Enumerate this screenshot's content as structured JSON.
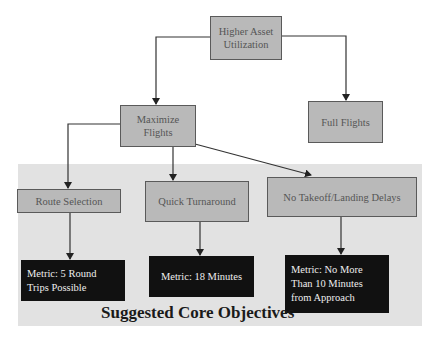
{
  "diagram": {
    "title": "Suggested Core Objectives",
    "nodes": {
      "root": "Higher Asset Utilization",
      "maximize": "Maximize Flights",
      "full": "Full Flights",
      "route": "Route Selection",
      "turnaround": "Quick Turnaround",
      "delays": "No Takeoff/Landing Delays"
    },
    "metrics": {
      "route": "Metric: 5 Round Trips Possible",
      "turnaround": "Metric: 18 Minutes",
      "delays": "Metric: No More Than 10 Minutes from Approach"
    },
    "colors": {
      "node_fill": "#b9b9b9",
      "metric_fill": "#111111",
      "region_fill": "#e2e2e2"
    }
  }
}
